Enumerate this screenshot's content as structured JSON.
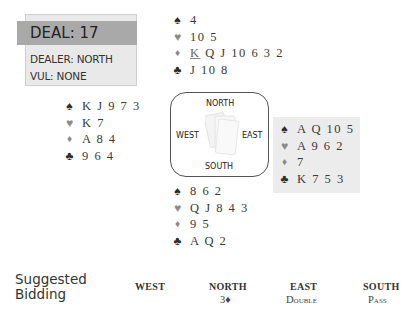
{
  "deal_info": {
    "title": "DEAL:  17",
    "dealer": "DEALER: NORTH",
    "vulnerability": "VUL: NONE"
  },
  "suit_symbols": {
    "spade": "♠",
    "heart": "♥",
    "diamond": "♦",
    "club": "♣"
  },
  "hands": {
    "north": {
      "spades": "4",
      "hearts": "10 5",
      "diamonds_lead": "K",
      "diamonds_rest": " Q J 10 6 3 2",
      "clubs": "J 10 8"
    },
    "west": {
      "spades": "K J 9 7 3",
      "hearts": "K 7",
      "diamonds": "A 8 4",
      "clubs": "9 6 4"
    },
    "east": {
      "spades": "A Q 10 5",
      "hearts": "A 9 6 2",
      "diamonds": "7",
      "clubs": "K 7 5 3"
    },
    "south": {
      "spades": "8 6 2",
      "hearts": "Q J 8 4 3",
      "diamonds": "9 5",
      "clubs": "A Q 2"
    }
  },
  "compass": {
    "north": "NORTH",
    "west": "WEST",
    "east": "EAST",
    "south": "SOUTH"
  },
  "bidding": {
    "label_line1": "Suggested",
    "label_line2": "Bidding",
    "headers": [
      "WEST",
      "NORTH",
      "EAST",
      "SOUTH"
    ],
    "bids": [
      "",
      "3♦",
      "Double",
      "Pass"
    ]
  }
}
